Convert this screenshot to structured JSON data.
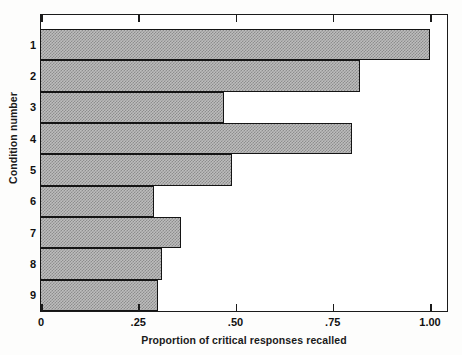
{
  "chart_data": {
    "type": "bar",
    "orientation": "horizontal",
    "title": "",
    "xlabel": "Proportion of critical responses recalled",
    "ylabel": "Condition number",
    "categories": [
      "1",
      "2",
      "3",
      "4",
      "5",
      "6",
      "7",
      "8",
      "9"
    ],
    "values": [
      1.0,
      0.82,
      0.47,
      0.8,
      0.49,
      0.29,
      0.36,
      0.31,
      0.3
    ],
    "xlim": [
      0,
      1.05
    ],
    "xticks": [
      0,
      0.25,
      0.5,
      0.75,
      1.0
    ],
    "xtick_labels": [
      "0",
      ".25",
      ".50",
      ".75",
      "1.00"
    ],
    "ytick_labels": [
      "1",
      "2",
      "3",
      "4",
      "5",
      "6",
      "7",
      "8",
      "9"
    ],
    "grid": false,
    "legend": false,
    "bar_fill_color": "#bdbdbd",
    "bar_pattern": "checkerboard-dither",
    "bar_edge_color": "#141414",
    "frame_color": "#1b1b1b",
    "background_color": "#ffffff"
  },
  "axes": {
    "x_title": "Proportion of critical responses recalled",
    "y_title": "Condition number",
    "x_ticks": [
      {
        "label": "0",
        "value": 0
      },
      {
        "label": ".25",
        "value": 0.25
      },
      {
        "label": ".50",
        "value": 0.5
      },
      {
        "label": ".75",
        "value": 0.75
      },
      {
        "label": "1.00",
        "value": 1.0
      }
    ],
    "y_ticks": [
      {
        "label": "1",
        "value": 1
      },
      {
        "label": "2",
        "value": 2
      },
      {
        "label": "3",
        "value": 3
      },
      {
        "label": "4",
        "value": 4
      },
      {
        "label": "5",
        "value": 5
      },
      {
        "label": "6",
        "value": 6
      },
      {
        "label": "7",
        "value": 7
      },
      {
        "label": "8",
        "value": 8
      },
      {
        "label": "9",
        "value": 9
      }
    ]
  }
}
